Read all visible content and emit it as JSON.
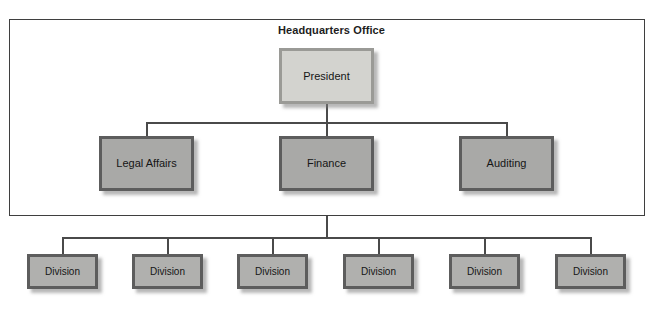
{
  "diagram": {
    "title": "Headquarters Office",
    "type": "organizational-chart",
    "colors": {
      "enclosure_border": "#3f3f3f",
      "connector": "#4a4a4a",
      "top_fill": "#d3d3cf",
      "top_border": "#9a9a96",
      "mid_fill": "#a9a9a7",
      "mid_border": "#5d5d5d",
      "division_fill": "#b0b0ae",
      "division_border": "#5d5d5d",
      "text": "#151515",
      "background": "#ffffff"
    },
    "enclosure_label": "Headquarters Office",
    "levels": {
      "top": {
        "nodes": [
          {
            "label": "President"
          }
        ]
      },
      "middle": {
        "nodes": [
          {
            "label": "Legal Affairs"
          },
          {
            "label": "Finance"
          },
          {
            "label": "Auditing"
          }
        ]
      },
      "bottom": {
        "nodes": [
          {
            "label": "Division"
          },
          {
            "label": "Division"
          },
          {
            "label": "Division"
          },
          {
            "label": "Division"
          },
          {
            "label": "Division"
          },
          {
            "label": "Division"
          }
        ]
      }
    }
  }
}
